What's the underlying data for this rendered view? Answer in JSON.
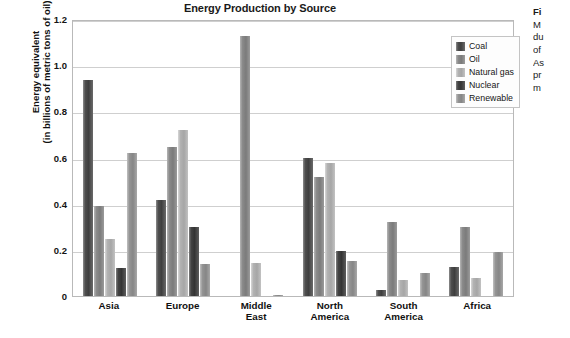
{
  "chart_data": {
    "type": "bar",
    "title": "Energy Production by Source",
    "xlabel": "",
    "ylabel_line1": "Energy equivalent",
    "ylabel_line2": "(in billions of metric tons of oil)",
    "ylim": [
      0,
      1.2
    ],
    "ytick_labels": [
      "1.2",
      "1.0",
      "0.8",
      "0.6",
      "0.4",
      "0.2",
      "0"
    ],
    "ytick_values": [
      1.2,
      1.0,
      0.8,
      0.6,
      0.4,
      0.2,
      0
    ],
    "grid": true,
    "legend_position": "top-right-inside",
    "categories": [
      "Asia",
      "Europe",
      "Middle East",
      "North America",
      "South America",
      "Africa"
    ],
    "category_lines": [
      [
        "Asia"
      ],
      [
        "Europe"
      ],
      [
        "Middle",
        "East"
      ],
      [
        "North",
        "America"
      ],
      [
        "South",
        "America"
      ],
      [
        "Africa"
      ]
    ],
    "series": [
      {
        "name": "Coal",
        "color": "#4f4f4f",
        "values": [
          0.935,
          0.415,
          0.0,
          0.6,
          0.025,
          0.125
        ]
      },
      {
        "name": "Oil",
        "color": "#8a8a8a",
        "values": [
          0.39,
          0.645,
          1.125,
          0.515,
          0.32,
          0.3
        ]
      },
      {
        "name": "Natural gas",
        "color": "#b2b2b2",
        "values": [
          0.245,
          0.72,
          0.145,
          0.575,
          0.07,
          0.08
        ]
      },
      {
        "name": "Nuclear",
        "color": "#434343",
        "values": [
          0.12,
          0.3,
          0.0,
          0.195,
          0.0,
          0.0
        ]
      },
      {
        "name": "Renewable",
        "color": "#949494",
        "values": [
          0.62,
          0.14,
          0.005,
          0.15,
          0.1,
          0.19
        ]
      }
    ]
  },
  "caption": {
    "head": "Fi",
    "lines": [
      "M",
      "du",
      "of",
      "As",
      "pr",
      "m"
    ]
  }
}
